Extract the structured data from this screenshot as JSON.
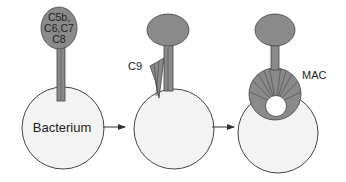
{
  "diagram": {
    "type": "process",
    "colors": {
      "complex_fill": "#8a8a8a",
      "bacterium_fill": "#f3f3f3",
      "outline": "#444444",
      "hole_fill": "#ffffff",
      "arrow": "#333333"
    },
    "stages": [
      {
        "id": "stage-1",
        "complex_label_lines": [
          "C5b,",
          "C6,C7",
          "C8"
        ],
        "target_label": "Bacterium"
      },
      {
        "id": "stage-2",
        "component_label": "C9"
      },
      {
        "id": "stage-3",
        "component_label": "MAC"
      }
    ],
    "arrows": [
      {
        "from": "stage-1",
        "to": "stage-2"
      },
      {
        "from": "stage-2",
        "to": "stage-3"
      }
    ]
  }
}
